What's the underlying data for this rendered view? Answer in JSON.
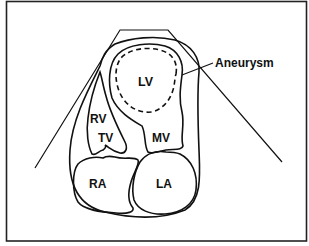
{
  "figure": {
    "colors": {
      "line": "#111111",
      "background": "#ffffff",
      "frame": "#222222"
    },
    "labels": {
      "lv": "LV",
      "rv": "RV",
      "tv": "TV",
      "mv": "MV",
      "ra": "RA",
      "la": "LA",
      "aneurysm": "Aneurysm"
    }
  }
}
